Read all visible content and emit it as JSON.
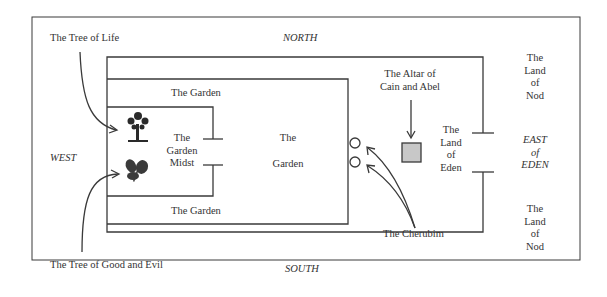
{
  "diagram": {
    "directions": {
      "north": "NORTH",
      "south": "SOUTH",
      "west": "WEST",
      "east": [
        "EAST",
        "of",
        "EDEN"
      ]
    },
    "regions": {
      "garden_top": "The Garden",
      "garden_bottom": "The Garden",
      "garden_center": [
        "The",
        "Garden"
      ],
      "garden_midst": [
        "The",
        "Garden",
        "Midst"
      ],
      "land_of_eden": [
        "The",
        "Land",
        "of",
        "Eden"
      ],
      "land_of_nod_north": [
        "The",
        "Land",
        "of",
        "Nod"
      ],
      "land_of_nod_south": [
        "The",
        "Land",
        "of",
        "Nod"
      ]
    },
    "callouts": {
      "tree_of_life": "The Tree of Life",
      "tree_of_good_and_evil": "The Tree of Good and Evil",
      "altar": [
        "The Altar of",
        "Cain and Abel"
      ],
      "cherubim": "The Cherubim"
    },
    "icons": {
      "tree_of_life": "tree-icon",
      "tree_of_good_and_evil": "leafy-plant-icon",
      "altar": "square-icon",
      "cherubim": "circle-icon"
    },
    "colors": {
      "line": "#3a3a3a",
      "altar_fill": "#c8c8c8",
      "background": "#ffffff"
    }
  }
}
